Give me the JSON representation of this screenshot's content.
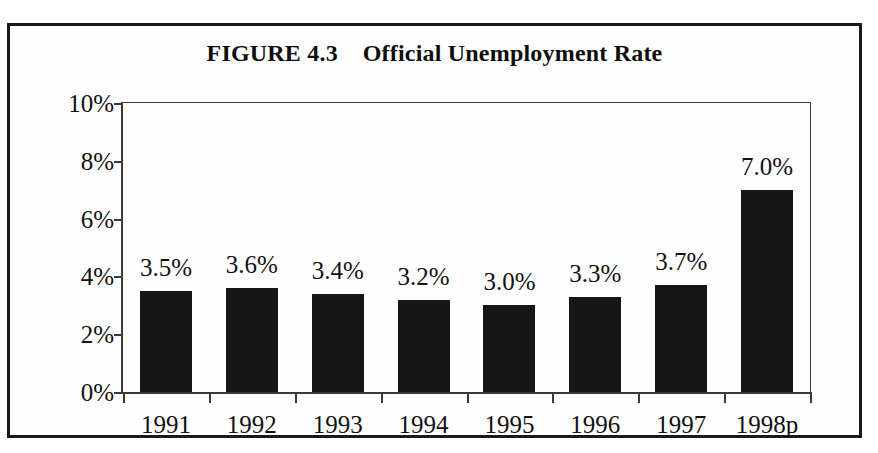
{
  "figure": {
    "title": "FIGURE 4.3    Official Unemployment Rate",
    "frame_color": "#1a1a1a",
    "background_color": "#fefefe"
  },
  "chart_data": {
    "type": "bar",
    "title": "FIGURE 4.3    Official Unemployment Rate",
    "xlabel": "",
    "ylabel": "",
    "categories": [
      "1991",
      "1992",
      "1993",
      "1994",
      "1995",
      "1996",
      "1997",
      "1998p"
    ],
    "values": [
      3.5,
      3.6,
      3.4,
      3.2,
      3.0,
      3.3,
      3.7,
      7.0
    ],
    "data_labels": [
      "3.5%",
      "3.6%",
      "3.4%",
      "3.2%",
      "3.0%",
      "3.3%",
      "3.7%",
      "7.0%"
    ],
    "ylim": [
      0,
      10
    ],
    "ytick_values": [
      0,
      2,
      4,
      6,
      8,
      10
    ],
    "ytick_labels": [
      "0%",
      "2%",
      "4%",
      "6%",
      "8%",
      "10%"
    ],
    "grid": false,
    "legend": null,
    "bar_color": "#161616",
    "axis_color": "#3a3a3a"
  }
}
